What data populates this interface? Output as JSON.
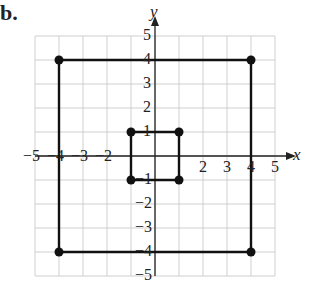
{
  "problem_label": "b.",
  "axes": {
    "x_label": "x",
    "y_label": "y",
    "x_ticks": [
      "−5",
      "−4",
      "−3",
      "−2",
      "2",
      "3",
      "4",
      "5"
    ],
    "y_ticks": [
      "5",
      "4",
      "3",
      "2",
      "1",
      "−1",
      "−2",
      "−3",
      "−4",
      "−5"
    ],
    "range": [
      -5,
      5
    ]
  },
  "colors": {
    "grid": "#cfcfcf",
    "axis": "#222222",
    "shape": "#111111"
  },
  "chart_data": {
    "type": "scatter",
    "title": "",
    "xlabel": "x",
    "ylabel": "y",
    "xlim": [
      -5,
      5
    ],
    "ylim": [
      -5,
      5
    ],
    "grid": true,
    "series": [
      {
        "name": "outer square",
        "points": [
          [
            -4,
            4
          ],
          [
            4,
            4
          ],
          [
            4,
            -4
          ],
          [
            -4,
            -4
          ]
        ],
        "closed": true
      },
      {
        "name": "inner square",
        "points": [
          [
            -1,
            1
          ],
          [
            1,
            1
          ],
          [
            1,
            -1
          ],
          [
            -1,
            -1
          ]
        ],
        "closed": true
      }
    ]
  }
}
